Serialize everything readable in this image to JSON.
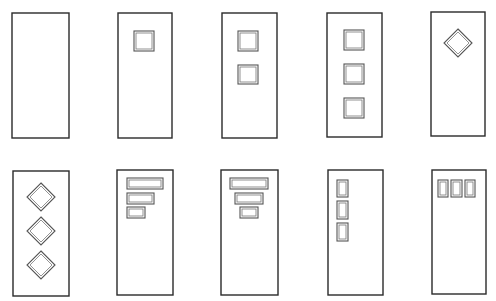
{
  "figure": {
    "background": "#ffffff",
    "line_color": "#2a2a2a",
    "doors": [
      {
        "id": "door-1",
        "rect": [
          12,
          13,
          57,
          125
        ],
        "windows": []
      },
      {
        "id": "door-2",
        "rect": [
          118,
          13,
          54,
          125
        ],
        "windows": [
          {
            "shape": "rect",
            "x": 134,
            "y": 31,
            "w": 20,
            "h": 20
          }
        ]
      },
      {
        "id": "door-3",
        "rect": [
          222,
          13,
          55,
          125
        ],
        "windows": [
          {
            "shape": "rect",
            "x": 238,
            "y": 31,
            "w": 20,
            "h": 20
          },
          {
            "shape": "rect",
            "x": 238,
            "y": 65,
            "w": 20,
            "h": 19
          }
        ]
      },
      {
        "id": "door-4",
        "rect": [
          327,
          13,
          55,
          124
        ],
        "windows": [
          {
            "shape": "rect",
            "x": 344,
            "y": 30,
            "w": 20,
            "h": 20
          },
          {
            "shape": "rect",
            "x": 344,
            "y": 64,
            "w": 20,
            "h": 20
          },
          {
            "shape": "rect",
            "x": 344,
            "y": 98,
            "w": 20,
            "h": 20
          }
        ]
      },
      {
        "id": "door-5",
        "rect": [
          431,
          12,
          54,
          124
        ],
        "windows": [
          {
            "shape": "diamond",
            "cx": 458,
            "cy": 43,
            "r": 14
          }
        ]
      },
      {
        "id": "door-6",
        "rect": [
          13,
          171,
          56,
          125
        ],
        "windows": [
          {
            "shape": "diamond",
            "cx": 41,
            "cy": 197,
            "r": 14
          },
          {
            "shape": "diamond",
            "cx": 41,
            "cy": 231,
            "r": 14
          },
          {
            "shape": "diamond",
            "cx": 41,
            "cy": 265,
            "r": 14
          }
        ]
      },
      {
        "id": "door-7",
        "rect": [
          117,
          170,
          56,
          125
        ],
        "windows": [
          {
            "shape": "rect",
            "x": 127,
            "y": 178,
            "w": 36,
            "h": 11
          },
          {
            "shape": "rect",
            "x": 127,
            "y": 193,
            "w": 27,
            "h": 11
          },
          {
            "shape": "rect",
            "x": 127,
            "y": 207,
            "w": 18,
            "h": 11
          }
        ]
      },
      {
        "id": "door-8",
        "rect": [
          221,
          170,
          57,
          125
        ],
        "windows": [
          {
            "shape": "rect",
            "x": 230,
            "y": 178,
            "w": 38,
            "h": 11
          },
          {
            "shape": "rect",
            "x": 235,
            "y": 193,
            "w": 28,
            "h": 11
          },
          {
            "shape": "rect",
            "x": 240,
            "y": 207,
            "w": 18,
            "h": 11
          }
        ]
      },
      {
        "id": "door-9",
        "rect": [
          328,
          170,
          55,
          125
        ],
        "windows": [
          {
            "shape": "rect",
            "x": 337,
            "y": 180,
            "w": 11,
            "h": 17
          },
          {
            "shape": "rect",
            "x": 337,
            "y": 201,
            "w": 11,
            "h": 18
          },
          {
            "shape": "rect",
            "x": 337,
            "y": 223,
            "w": 11,
            "h": 18
          }
        ]
      },
      {
        "id": "door-10",
        "rect": [
          432,
          170,
          54,
          124
        ],
        "windows": [
          {
            "shape": "rect",
            "x": 438,
            "y": 180,
            "w": 10,
            "h": 17
          },
          {
            "shape": "rect",
            "x": 451,
            "y": 180,
            "w": 11,
            "h": 17
          },
          {
            "shape": "rect",
            "x": 465,
            "y": 180,
            "w": 10,
            "h": 17
          }
        ]
      }
    ]
  }
}
